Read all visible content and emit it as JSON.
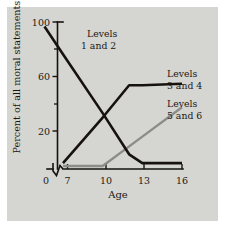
{
  "figure": {
    "background_color": "#ffffff",
    "panel_color": "#d5d5d1",
    "ink_color": "#16130f",
    "gray_series_color": "#8d8d88"
  },
  "chart_data": {
    "type": "line",
    "title": "",
    "xlabel": "Age",
    "ylabel": "Percent of all moral statements",
    "xlim": [
      5,
      17
    ],
    "ylim": [
      0,
      100
    ],
    "grid": false,
    "axis_break": "x-axis break between 0 and 7",
    "legend_position": "inline annotations next to lines",
    "xticks": [
      "0",
      "7",
      "10",
      "13",
      "16"
    ],
    "xtick_values": [
      0,
      7,
      10,
      13,
      16
    ],
    "yticks": [
      "20",
      "60",
      "100"
    ],
    "ytick_values": [
      20,
      60,
      100
    ],
    "yticks_minor": [
      40,
      80
    ],
    "series": [
      {
        "name": "Levels 1 and 2",
        "label_line1": "Levels",
        "label_line2": "1 and 2",
        "color": "#16130f",
        "x": [
          5.6,
          7,
          10,
          12,
          13,
          16
        ],
        "values": [
          97,
          78,
          38,
          10,
          4,
          4
        ]
      },
      {
        "name": "Levels 3 and 4",
        "label_line1": "Levels",
        "label_line2": "3 and 4",
        "color": "#16130f",
        "x": [
          7,
          10,
          12,
          13,
          16
        ],
        "values": [
          4,
          35,
          57,
          57,
          58
        ]
      },
      {
        "name": "Levels 5 and 6",
        "label_line1": "Levels",
        "label_line2": "5 and 6",
        "color": "#8d8d88",
        "x": [
          7,
          10,
          13,
          16
        ],
        "values": [
          2,
          2,
          22,
          42
        ]
      }
    ]
  }
}
